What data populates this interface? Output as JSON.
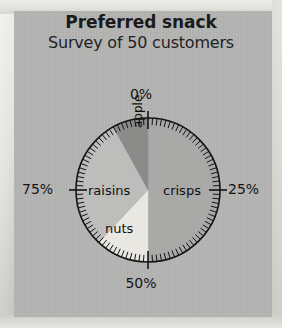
{
  "page": {
    "title": "Preferred snack",
    "subtitle": "Survey of 50 customers"
  },
  "colors": {
    "page_background": "#b2b2b1",
    "crisps": "#a9a9a8",
    "raisins": "#bdbdbc",
    "nuts": "#e9e7e1",
    "apple": "#8b8b8a",
    "outline": "#141414",
    "text": "#141414"
  },
  "scale": {
    "labels": [
      "0%",
      "25%",
      "50%",
      "75%"
    ],
    "label_0": "0%",
    "label_25": "25%",
    "label_50": "50%",
    "label_75": "75%",
    "minor_ticks": 100,
    "major_ticks": 4
  },
  "chart_data": {
    "type": "pie",
    "title": "Preferred snack",
    "subtitle": "Survey of 50 customers",
    "total_respondents": 50,
    "units": "percent",
    "start_angle_deg": 0,
    "direction": "clockwise",
    "axis_ticks": [
      "0%",
      "25%",
      "50%",
      "75%"
    ],
    "grid": false,
    "legend": "none",
    "labels_inside_slices": true,
    "categories": [
      "crisps",
      "nuts",
      "raisins",
      "apple"
    ],
    "values": [
      50,
      12,
      30,
      8
    ],
    "counts": [
      25,
      6,
      15,
      4
    ],
    "slices": [
      {
        "label": "crisps",
        "percent": 50,
        "count": 25,
        "start_percent": 0,
        "end_percent": 50,
        "color": "#a9a9a8"
      },
      {
        "label": "nuts",
        "percent": 12,
        "count": 6,
        "start_percent": 50,
        "end_percent": 62,
        "color": "#e9e7e1"
      },
      {
        "label": "raisins",
        "percent": 30,
        "count": 15,
        "start_percent": 62,
        "end_percent": 92,
        "color": "#bdbdbc"
      },
      {
        "label": "apple",
        "percent": 8,
        "count": 4,
        "start_percent": 92,
        "end_percent": 100,
        "color": "#8b8b8a"
      }
    ]
  }
}
